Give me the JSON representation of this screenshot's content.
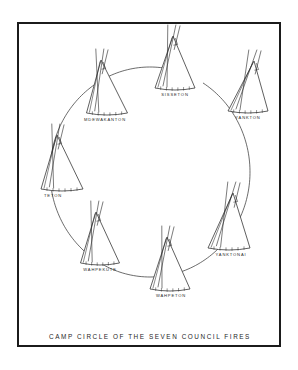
{
  "figure": {
    "caption": "CAMP CIRCLE OF THE  SEVEN  COUNCIL FIRES",
    "border_color": "#1b1b1b",
    "background_color": "#ffffff",
    "ink_color": "#2b2b2b"
  },
  "chart_data": {
    "type": "diagram",
    "title": "CAMP CIRCLE OF THE  SEVEN  COUNCIL FIRES",
    "subtype": "camp-circle",
    "circle": {
      "center_x": 150,
      "center_y": 172,
      "radius_x": 100,
      "radius_y": 105,
      "stroke": "#2c2c2c",
      "closed": false
    },
    "categories": [
      "SISSETON",
      "YANKTON",
      "YANKTONAI",
      "WAHPETON",
      "WAHPEKUTE",
      "TETON",
      "MDEWAKANTON"
    ],
    "count": 7,
    "nodes": [
      {
        "label": "SISSETON",
        "label_x": 175,
        "label_y": 96,
        "tipi_x": 175,
        "tipi_y": 88,
        "tipi_w": 40,
        "tipi_h": 52,
        "lean": -2,
        "stakes": 6,
        "position": "top"
      },
      {
        "label": "YANKTON",
        "label_x": 248,
        "label_y": 119,
        "tipi_x": 248,
        "tipi_y": 111,
        "tipi_w": 40,
        "tipi_h": 50,
        "lean": 6,
        "stakes": 6,
        "position": "top-right"
      },
      {
        "label": "YANKTONAI",
        "label_x": 231,
        "label_y": 256,
        "tipi_x": 229,
        "tipi_y": 248,
        "tipi_w": 42,
        "tipi_h": 55,
        "lean": 4,
        "stakes": 6,
        "position": "right"
      },
      {
        "label": "WAHPETON",
        "label_x": 171,
        "label_y": 297,
        "tipi_x": 170,
        "tipi_y": 289,
        "tipi_w": 40,
        "tipi_h": 52,
        "lean": -3,
        "stakes": 6,
        "position": "bottom"
      },
      {
        "label": "WAHPEKUTE",
        "label_x": 100,
        "label_y": 271,
        "tipi_x": 100,
        "tipi_y": 263,
        "tipi_w": 39,
        "tipi_h": 51,
        "lean": -4,
        "stakes": 6,
        "position": "bottom-left"
      },
      {
        "label": "TETON",
        "label_x": 53,
        "label_y": 197,
        "tipi_x": 62,
        "tipi_y": 189,
        "tipi_w": 42,
        "tipi_h": 54,
        "lean": -5,
        "stakes": 6,
        "position": "left"
      },
      {
        "label": "MDEWAKANTON",
        "label_x": 105,
        "label_y": 121,
        "tipi_x": 107,
        "tipi_y": 113,
        "tipi_w": 41,
        "tipi_h": 53,
        "lean": -6,
        "stakes": 6,
        "position": "top-left"
      }
    ],
    "caption_x": 150,
    "caption_y": 339
  }
}
